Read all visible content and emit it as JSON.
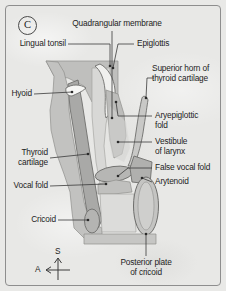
{
  "figure": {
    "panel_label": "C",
    "background_color": "#e8e8e6",
    "border_color": "#8e8e8e",
    "text_color": "#1d1d1d"
  },
  "labels": {
    "quadrangular_membrane": "Quadrangular membrane",
    "lingual_tonsil": "Lingual tonsil",
    "epiglottis": "Epiglottis",
    "superior_horn_line1": "Superior horn of",
    "superior_horn_line2": "thyroid cartilage",
    "hyoid": "Hyoid",
    "aryepiglottic_line1": "Aryepiglottic",
    "aryepiglottic_line2": "fold",
    "vestibule_line1": "Vestibule",
    "vestibule_line2": "of larynx",
    "thyroid_cartilage_line1": "Thyroid",
    "thyroid_cartilage_line2": "cartilage",
    "false_vocal_fold": "False vocal fold",
    "arytenoid": "Arytenoid",
    "vocal_fold": "Vocal fold",
    "cricoid": "Cricoid",
    "posterior_plate_line1": "Posterior plate",
    "posterior_plate_line2": "of cricoid"
  },
  "compass": {
    "superior": "S",
    "anterior": "A"
  },
  "anatomy_colors": {
    "soft_tissue_fill": "#bdbdbb",
    "cartilage_fill": "#a9a9a7",
    "airway_fill": "#d6d6d4",
    "highlight_fill": "#f2f2f0",
    "outline": "#6e6e6c",
    "leader_line": "#3a3a3a"
  }
}
